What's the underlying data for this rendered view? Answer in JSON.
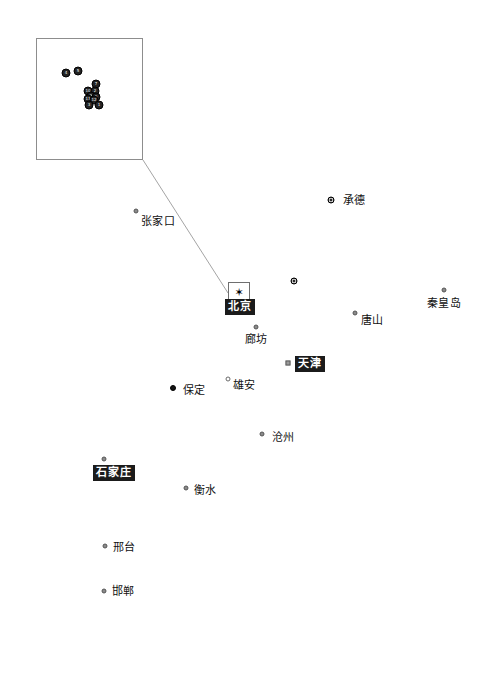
{
  "figure": {
    "region_name": "京津冀",
    "frame": {
      "x": 24,
      "y": 22,
      "width": 445,
      "height": 652,
      "border_color": "#1d1d1d"
    },
    "background_color": "#ffffff"
  },
  "inset": {
    "name": "inset-magnifier",
    "x": 36,
    "y": 38,
    "width": 107,
    "height": 122,
    "border_color": "#8d8d8d",
    "cluster_points": [
      {
        "label": "4",
        "x": 66,
        "y": 73
      },
      {
        "label": "5",
        "x": 78,
        "y": 71
      },
      {
        "label": "7",
        "x": 96,
        "y": 84
      },
      {
        "label": "10",
        "x": 88,
        "y": 91
      },
      {
        "label": "2",
        "x": 95,
        "y": 91
      },
      {
        "label": "9",
        "x": 91,
        "y": 96
      },
      {
        "label": "6",
        "x": 96,
        "y": 97
      },
      {
        "label": "11",
        "x": 88,
        "y": 99
      },
      {
        "label": "12",
        "x": 94,
        "y": 100
      },
      {
        "label": "3",
        "x": 89,
        "y": 105
      },
      {
        "label": "1",
        "x": 99,
        "y": 105
      }
    ]
  },
  "leader_line": {
    "name": "inset-leader-line",
    "color": "#9a9a9a",
    "from": {
      "x": 143,
      "y": 160
    },
    "to": {
      "x": 228,
      "y": 293
    }
  },
  "beijing_detail_box": {
    "name": "capital-detail-box",
    "x": 228,
    "y": 282,
    "width": 22,
    "height": 21,
    "border_color": "#6f6f6f",
    "star_glyph": "✶"
  },
  "legend_colors": {
    "capital_highlight_bg": "#1b1b1b",
    "capital_highlight_text": "#ffffff",
    "marker_dark": "#141414",
    "marker_mid": "#8a8a8a",
    "marker_light": "#ffffff",
    "frame": "#1d1d1d"
  },
  "cities": [
    {
      "name": "张家口",
      "pinyin_id": "zhangjiakou",
      "marker": {
        "x": 136,
        "y": 211,
        "style": "dot-mid"
      },
      "label": {
        "x": 158,
        "y": 215,
        "style": "plain"
      }
    },
    {
      "name": "承德",
      "pinyin_id": "chengde",
      "marker": {
        "x": 331,
        "y": 200,
        "style": "ring-dark"
      },
      "label": {
        "x": 354,
        "y": 194,
        "style": "plain"
      }
    },
    {
      "name": "",
      "pinyin_id": "unlabeled-point-north",
      "marker": {
        "x": 294,
        "y": 281,
        "style": "ring-dark"
      },
      "label": null
    },
    {
      "name": "北京",
      "pinyin_id": "beijing",
      "marker": {
        "x": 239,
        "y": 292,
        "style": "capital-star"
      },
      "label": {
        "x": 240,
        "y": 299,
        "style": "highlight"
      }
    },
    {
      "name": "秦皇岛",
      "pinyin_id": "qinhuangdao",
      "marker": {
        "x": 444,
        "y": 290,
        "style": "dot-mid"
      },
      "label": {
        "x": 444,
        "y": 297,
        "style": "plain"
      }
    },
    {
      "name": "唐山",
      "pinyin_id": "tangshan",
      "marker": {
        "x": 355,
        "y": 313,
        "style": "dot-mid"
      },
      "label": {
        "x": 372,
        "y": 314,
        "style": "plain"
      }
    },
    {
      "name": "廊坊",
      "pinyin_id": "langfang",
      "marker": {
        "x": 256,
        "y": 327,
        "style": "dot-mid"
      },
      "label": {
        "x": 256,
        "y": 333,
        "style": "plain"
      }
    },
    {
      "name": "天津",
      "pinyin_id": "tianjin",
      "marker": {
        "x": 288,
        "y": 363,
        "style": "square-mid"
      },
      "label": {
        "x": 310,
        "y": 356,
        "style": "highlight"
      }
    },
    {
      "name": "雄安",
      "pinyin_id": "xiongan",
      "marker": {
        "x": 228,
        "y": 379,
        "style": "dot-light"
      },
      "label": {
        "x": 244,
        "y": 379,
        "style": "plain"
      }
    },
    {
      "name": "保定",
      "pinyin_id": "baoding",
      "marker": {
        "x": 173,
        "y": 388,
        "style": "dot-dark"
      },
      "label": {
        "x": 194,
        "y": 384,
        "style": "plain"
      }
    },
    {
      "name": "沧州",
      "pinyin_id": "cangzhou",
      "marker": {
        "x": 262,
        "y": 434,
        "style": "dot-mid"
      },
      "label": {
        "x": 283,
        "y": 431,
        "style": "plain"
      }
    },
    {
      "name": "石家庄",
      "pinyin_id": "shijiazhuang",
      "marker": {
        "x": 104,
        "y": 459,
        "style": "dot-mid"
      },
      "label": {
        "x": 114,
        "y": 465,
        "style": "highlight"
      }
    },
    {
      "name": "衡水",
      "pinyin_id": "hengshui",
      "marker": {
        "x": 186,
        "y": 488,
        "style": "dot-mid"
      },
      "label": {
        "x": 205,
        "y": 484,
        "style": "plain"
      }
    },
    {
      "name": "邢台",
      "pinyin_id": "xingtai",
      "marker": {
        "x": 105,
        "y": 546,
        "style": "dot-mid"
      },
      "label": {
        "x": 124,
        "y": 541,
        "style": "plain"
      }
    },
    {
      "name": "邯郸",
      "pinyin_id": "handan",
      "marker": {
        "x": 104,
        "y": 591,
        "style": "dot-mid"
      },
      "label": {
        "x": 123,
        "y": 585,
        "style": "plain"
      }
    }
  ]
}
